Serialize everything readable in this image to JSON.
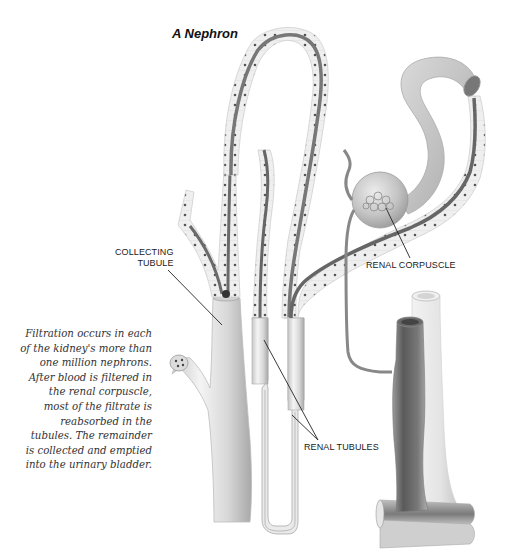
{
  "diagram": {
    "title": "A Nephron",
    "caption_lines": [
      "Filtration occurs in each",
      "of the kidney's more than",
      "one million nephrons.",
      "After blood is filtered in",
      "the renal corpuscle,",
      "most of the filtrate is",
      "reabsorbed in the",
      "tubules. The remainder",
      "is collected and emptied",
      "into the urinary bladder."
    ],
    "labels": {
      "collecting_tubule_line1": "COLLECTING",
      "collecting_tubule_line2": "TUBULE",
      "renal_corpuscle": "RENAL CORPUSCLE",
      "renal_tubules": "RENAL TUBULES"
    },
    "parts": [
      "collecting-tubule",
      "renal-tubules",
      "loop-of-henle",
      "renal-corpuscle",
      "blood-vessels"
    ],
    "colors": {
      "tubule_wall": "#e6e6e6",
      "tubule_lumen": "#7a7a7a",
      "vessel_dark": "#6e6e6e",
      "vessel_light": "#e8e8e8",
      "text": "#1a1a1a"
    }
  }
}
